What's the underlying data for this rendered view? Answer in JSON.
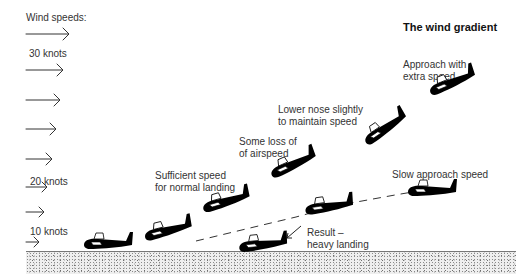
{
  "title": "The wind gradient",
  "wind_scale": {
    "heading": "Wind speeds:",
    "labels": {
      "top": "30 knots",
      "middle": "20 knots",
      "bottom": "10 knots"
    },
    "arrow_count": 9,
    "arrow_lengths_px": [
      36,
      32,
      29,
      27,
      25,
      23,
      20,
      17,
      13
    ]
  },
  "annotations": {
    "approach_extra": [
      "Approach with",
      "extra speed"
    ],
    "lower_nose": [
      "Lower nose slightly",
      "to maintain speed"
    ],
    "loss_airspeed": [
      "Some loss of",
      "of airspeed"
    ],
    "sufficient_speed": [
      "Sufficient speed",
      "for normal landing"
    ],
    "slow_approach": "Slow approach speed",
    "result": [
      "Result –",
      "heavy landing"
    ]
  },
  "gliders": [
    {
      "id": "landed",
      "x": 108,
      "y": 243,
      "angle": 0
    },
    {
      "id": "normal-1",
      "x": 168,
      "y": 230,
      "angle": -14
    },
    {
      "id": "normal-2",
      "x": 226,
      "y": 201,
      "angle": -16
    },
    {
      "id": "loss-airspeed",
      "x": 293,
      "y": 164,
      "angle": -24
    },
    {
      "id": "lower-nose",
      "x": 385,
      "y": 128,
      "angle": -34
    },
    {
      "id": "extra-speed",
      "x": 452,
      "y": 82,
      "angle": -22
    },
    {
      "id": "slow-approach",
      "x": 432,
      "y": 190,
      "angle": 0
    },
    {
      "id": "slow-mid",
      "x": 329,
      "y": 206,
      "angle": -8
    },
    {
      "id": "heavy-landing",
      "x": 263,
      "y": 244,
      "angle": -6
    }
  ],
  "colors": {
    "ink": "#000000",
    "text": "#333333",
    "ground_line": "#777777"
  }
}
